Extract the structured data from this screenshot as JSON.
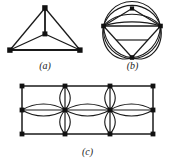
{
  "figure": {
    "background_color": "#ffffff",
    "stroke_color": "#1a1a1a",
    "node_color": "#111111",
    "panels": [
      {
        "id": "a",
        "caption": "(a)",
        "graph_type": "planar-K4",
        "description": "Triangle with a central vertex joined to all three corners",
        "vertex_count": 4,
        "edge_count": 6,
        "vertices": [
          {
            "label": "top",
            "x": 43,
            "y": 8
          },
          {
            "label": "bottom-left",
            "x": 8,
            "y": 50
          },
          {
            "label": "bottom-right",
            "x": 78,
            "y": 50
          },
          {
            "label": "center",
            "x": 43,
            "y": 34
          }
        ],
        "edges": [
          [
            "top",
            "bottom-left"
          ],
          [
            "top",
            "bottom-right"
          ],
          [
            "bottom-left",
            "bottom-right"
          ],
          [
            "center",
            "top"
          ],
          [
            "center",
            "bottom-left"
          ],
          [
            "center",
            "bottom-right"
          ]
        ]
      },
      {
        "id": "b",
        "caption": "(b)",
        "graph_type": "triangle-with-multiple-arcs",
        "description": "Inner triangle whose three corner vertices are also joined by several nested circular arcs",
        "vertex_count": 4,
        "edge_count": 12,
        "vertices": [
          {
            "label": "left",
            "x": 12,
            "y": 25
          },
          {
            "label": "right",
            "x": 72,
            "y": 25
          },
          {
            "label": "bottom",
            "x": 42,
            "y": 57
          },
          {
            "label": "apex",
            "x": 42,
            "y": 25
          }
        ]
      },
      {
        "id": "c",
        "caption": "(c)",
        "graph_type": "3x4-grid-with-multi-edges",
        "description": "Three rows by four columns of vertices; inner vertices joined by bundles of parallel lens-shaped edges",
        "rows": 3,
        "columns": 4,
        "vertex_count": 12,
        "column_x": [
          20,
          65,
          110,
          155
        ],
        "row_y": [
          8,
          32,
          56
        ],
        "multi_edge_bundles": 3
      }
    ]
  }
}
